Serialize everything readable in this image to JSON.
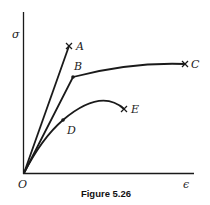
{
  "figure": {
    "caption": "Figure 5.26",
    "axes": {
      "y_label": "σ",
      "x_label": "ϵ",
      "origin_label": "O"
    },
    "curves": [
      {
        "id": "A",
        "label": "A",
        "end_marker": "x",
        "description": "linear to fracture"
      },
      {
        "id": "C",
        "label": "C",
        "end_marker": "x",
        "description": "linear to B then plateau to fracture at C"
      },
      {
        "id": "E",
        "label": "E",
        "end_marker": "x",
        "description": "rising to D, peak, then down to fracture at E"
      }
    ],
    "points": [
      {
        "id": "B",
        "label": "B"
      },
      {
        "id": "D",
        "label": "D"
      }
    ]
  },
  "colors": {
    "line": "#1a1a1a",
    "background": "#ffffff"
  }
}
